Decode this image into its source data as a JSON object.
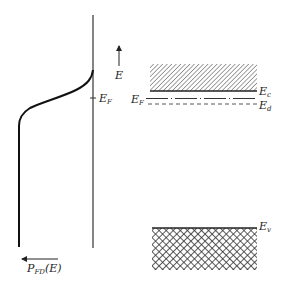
{
  "diagram": {
    "left_panel": {
      "energy_axis_label": "E",
      "fermi_level_label": "E",
      "fermi_level_sub": "F",
      "x_axis_label": "P",
      "x_axis_sub": "FD",
      "x_axis_suffix": "(E)",
      "curve": "Fermi-Dirac occupancy probability vs energy"
    },
    "right_panel": {
      "conduction_band_label": "E",
      "conduction_band_sub": "c",
      "fermi_level_label": "E",
      "fermi_level_sub": "F",
      "donor_level_label": "E",
      "donor_level_sub": "d",
      "valence_band_label": "E",
      "valence_band_sub": "v"
    },
    "colors": {
      "ink": "#222222",
      "background": "#ffffff"
    }
  }
}
